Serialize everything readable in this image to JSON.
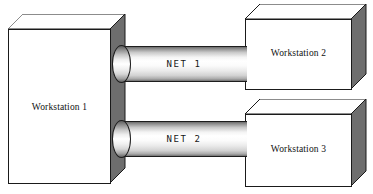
{
  "diagram": {
    "background_color": "#ffffff",
    "box_face_color": "#ffffff",
    "box_side_color": "#6e6e6e",
    "outline_color": "#1a1a1a",
    "nodes": [
      {
        "id": "workstation-1",
        "label": "Workstation 1"
      },
      {
        "id": "workstation-2",
        "label": "Workstation 2"
      },
      {
        "id": "workstation-3",
        "label": "Workstation 3"
      }
    ],
    "links": [
      {
        "id": "net-1",
        "label": "NET 1",
        "from": "Workstation 1",
        "to": "Workstation 2"
      },
      {
        "id": "net-2",
        "label": "NET 2",
        "from": "Workstation 1",
        "to": "Workstation 3"
      }
    ]
  }
}
